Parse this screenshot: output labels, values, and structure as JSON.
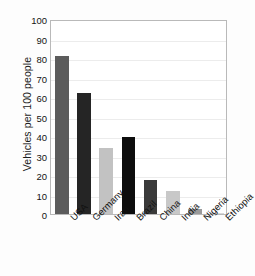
{
  "chart_data": {
    "type": "bar",
    "title": "",
    "xlabel": "",
    "ylabel": "Vehicles per 100 people",
    "categories": [
      "USA",
      "Germany",
      "Iran",
      "Brazil",
      "China",
      "India",
      "Nigeria",
      "Ethiopia"
    ],
    "values": [
      81,
      62,
      34,
      39.5,
      17.5,
      12,
      2.5,
      0.3
    ],
    "bar_colors": [
      "#5c5c5c",
      "#252525",
      "#c2c2c2",
      "#0d0d0d",
      "#3a3a3a",
      "#c8c8c8",
      "#9a9a9a",
      "#d8d8d8"
    ],
    "ylim": [
      0,
      100
    ],
    "ytick_labels": [
      "0",
      "10",
      "20",
      "30",
      "40",
      "50",
      "60",
      "70",
      "80",
      "90",
      "100"
    ],
    "ytick_values": [
      0,
      10,
      20,
      30,
      40,
      50,
      60,
      70,
      80,
      90,
      100
    ],
    "grid": true,
    "legend": "none",
    "xtick_rotation": -45,
    "frame_color": "#b9b9b9",
    "gridline_color": "#ececec",
    "background": "#ffffff"
  }
}
